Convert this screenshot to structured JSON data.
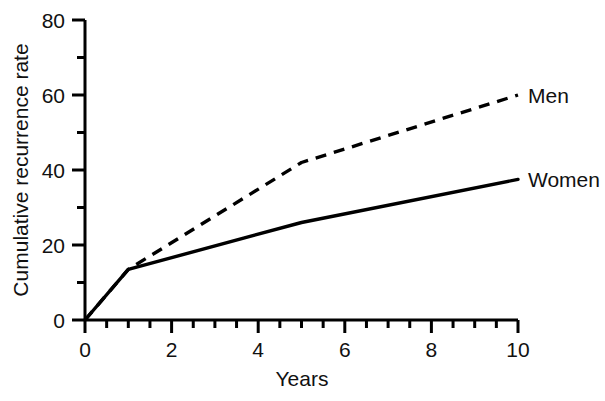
{
  "chart_data": {
    "type": "line",
    "title": "",
    "xlabel": "Years",
    "ylabel": "Cumulative recurrence rate",
    "xlim": [
      0,
      10
    ],
    "ylim": [
      0,
      80
    ],
    "grid": false,
    "legend_position": "right-of-plot-inline-labels",
    "x_ticks_major": [
      0,
      2,
      4,
      6,
      8,
      10
    ],
    "x_tick_labels": [
      "0",
      "2",
      "4",
      "6",
      "8",
      "10"
    ],
    "x_ticks_minor": [
      0.5,
      1,
      1.5,
      2.5,
      3,
      3.5,
      4.5,
      5,
      5.5,
      6.5,
      7,
      7.5,
      8.5,
      9,
      9.5
    ],
    "y_ticks_major": [
      0,
      20,
      40,
      60,
      80
    ],
    "y_tick_labels": [
      "0",
      "20",
      "40",
      "60",
      "80"
    ],
    "y_ticks_minor": [
      10,
      30,
      50,
      70
    ],
    "series": [
      {
        "name": "Men",
        "label": "Men",
        "style": "dashed",
        "color": "#000000",
        "x": [
          0,
          1,
          5,
          10
        ],
        "values": [
          0,
          13.5,
          42,
          60
        ]
      },
      {
        "name": "Women",
        "label": "Women",
        "style": "solid",
        "color": "#000000",
        "x": [
          0,
          1,
          5,
          10
        ],
        "values": [
          0,
          13.5,
          26,
          37.5
        ]
      }
    ]
  },
  "labels": {
    "men": "Men",
    "women": "Women",
    "x_axis_title": "Years",
    "y_axis_title": "Cumulative recurrence rate"
  },
  "ticks": {
    "x": [
      "0",
      "2",
      "4",
      "6",
      "8",
      "10"
    ],
    "y": [
      "0",
      "20",
      "40",
      "60",
      "80"
    ]
  }
}
